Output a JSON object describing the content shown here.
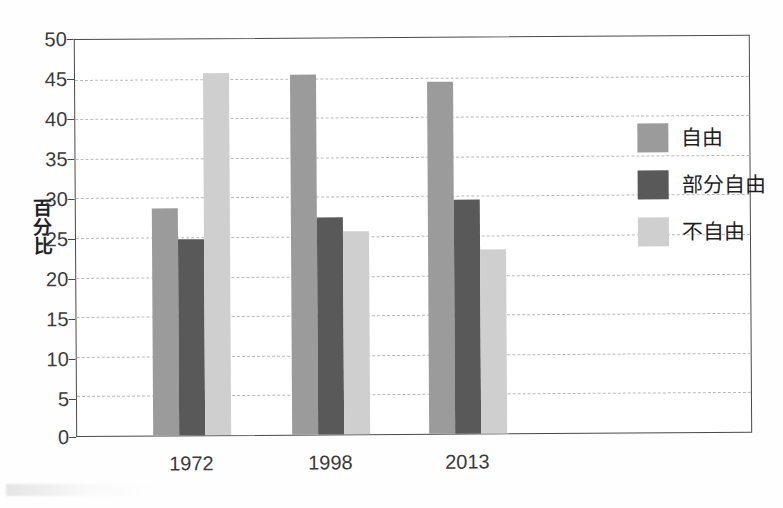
{
  "chart_data": {
    "type": "bar",
    "title": "",
    "subtitle": "",
    "xlabel": "",
    "ylabel": "百分比",
    "categories": [
      "1972",
      "1998",
      "2013"
    ],
    "series": [
      {
        "name": "自由",
        "color": "#9b9b9b",
        "values": [
          28.7,
          45.5,
          44.4
        ]
      },
      {
        "name": "部分自由",
        "color": "#595959",
        "values": [
          24.7,
          27.4,
          29.5
        ]
      },
      {
        "name": "不自由",
        "color": "#cfcfcf",
        "values": [
          45.7,
          25.6,
          23.2
        ]
      }
    ],
    "ylim": [
      0,
      50
    ],
    "y_ticks": [
      0,
      5,
      10,
      15,
      20,
      25,
      30,
      35,
      40,
      45,
      50
    ],
    "y_tick_labels": [
      "0",
      "5",
      "10",
      "15",
      "20",
      "25",
      "30",
      "35",
      "40",
      "45",
      "50"
    ],
    "grid": true,
    "grid_style": "dashed-horizontal",
    "legend_position": "inside-top-right",
    "frame": true,
    "background_color": "#ffffff",
    "axis_color": "#4a4a4a",
    "gridline_color": "#b9b9b9"
  },
  "legend": {
    "items": [
      {
        "label": "自由",
        "color": "#9b9b9b"
      },
      {
        "label": "部分自由",
        "color": "#595959"
      },
      {
        "label": "不自由",
        "color": "#cfcfcf"
      }
    ]
  },
  "axes": {
    "y_title": "百分比",
    "y_tick_labels": [
      "50",
      "45",
      "40",
      "35",
      "30",
      "25",
      "20",
      "15",
      "10",
      "5",
      "0"
    ],
    "x_tick_labels": [
      "1972",
      "1998",
      "2013"
    ]
  }
}
